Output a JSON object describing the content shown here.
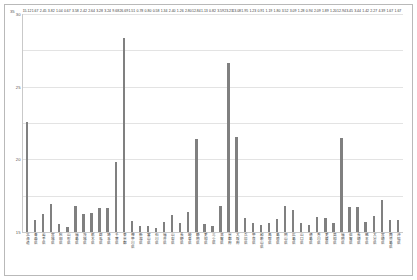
{
  "chart_data": {
    "type": "bar",
    "title": "",
    "subtitle": "",
    "xlabel": "",
    "ylabel": "",
    "axis_corner_label": "35",
    "ylim": [
      0,
      30
    ],
    "yticks": [
      0,
      5,
      10,
      15,
      20,
      25,
      30
    ],
    "ytick_labels": [
      "0",
      "5",
      "10",
      "15",
      "20",
      "25",
      "30"
    ],
    "grid": true,
    "legend": "none",
    "bar_color": "#808080",
    "categories": [
      "北海道",
      "青森県",
      "岩手県",
      "宮城県",
      "秋田県",
      "山形県",
      "福島県",
      "茨城県",
      "栃木県",
      "群馬県",
      "埼玉県",
      "千葉県",
      "東京都",
      "神奈川県",
      "新潟県",
      "富山県",
      "石川県",
      "福井県",
      "山梨県",
      "長野県",
      "岐阜県",
      "静岡県",
      "愛知県",
      "三重県",
      "滋賀県",
      "京都府",
      "大阪府",
      "兵庫県",
      "奈良県",
      "和歌山県",
      "鳥取県",
      "島根県",
      "岡山県",
      "広島県",
      "山口県",
      "徳島県",
      "香川県",
      "愛媛県",
      "高知県",
      "福岡県",
      "佐賀県",
      "長崎県",
      "熊本県",
      "大分県",
      "宮崎県",
      "鹿児島県",
      "沖縄県"
    ],
    "values": [
      15.12,
      1.67,
      2.45,
      3.82,
      1.04,
      0.67,
      3.58,
      2.42,
      2.64,
      3.28,
      3.24,
      9.68,
      26.69,
      1.51,
      0.78,
      0.8,
      0.58,
      1.34,
      2.4,
      1.26,
      2.8,
      12.84,
      1.13,
      0.82,
      3.59,
      23.23,
      13.08,
      1.95,
      1.23,
      0.91,
      1.19,
      1.8,
      3.52,
      3.09,
      1.28,
      0.94,
      2.09,
      1.89,
      1.2,
      12.94,
      3.45,
      3.44,
      1.42,
      2.27,
      4.39,
      1.67,
      1.67
    ],
    "value_labels": [
      "15.12",
      "1.67",
      "2.45",
      "3.82",
      "1.04",
      "0.67",
      "3.58",
      "2.42",
      "2.64",
      "3.28",
      "3.24",
      "9.68",
      "26.69",
      "1.51",
      "0.78",
      "0.80",
      "0.58",
      "1.34",
      "2.40",
      "1.26",
      "2.80",
      "12.84",
      "1.13",
      "0.82",
      "3.59",
      "23.23",
      "13.08",
      "1.95",
      "1.23",
      "0.91",
      "1.19",
      "1.80",
      "3.52",
      "3.09",
      "1.28",
      "0.94",
      "2.09",
      "1.89",
      "1.20",
      "12.94",
      "3.45",
      "3.44",
      "1.42",
      "2.27",
      "4.39",
      "1.67",
      "1.67"
    ]
  }
}
